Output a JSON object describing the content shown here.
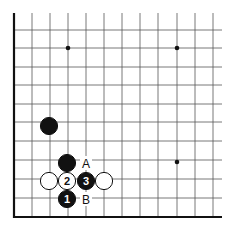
{
  "diagram": {
    "type": "go-board-corner",
    "corner": "bottom-left",
    "colors": {
      "line": "#555555",
      "border": "#111111",
      "black": "#111111",
      "white": "#ffffff",
      "background": "#ffffff"
    },
    "star_points": [
      {
        "x": 68,
        "y": 48
      },
      {
        "x": 177,
        "y": 48
      },
      {
        "x": 177,
        "y": 162
      }
    ],
    "stones": [
      {
        "id": "black-stone-upper",
        "color": "black",
        "x": 49,
        "y": 126,
        "label": ""
      },
      {
        "id": "black-stone-a",
        "color": "black",
        "x": 67,
        "y": 163,
        "label": ""
      },
      {
        "id": "white-stone-left",
        "color": "white",
        "x": 49,
        "y": 181,
        "label": ""
      },
      {
        "id": "white-stone-2",
        "color": "white",
        "x": 67,
        "y": 181,
        "label": "2"
      },
      {
        "id": "black-stone-3",
        "color": "black",
        "x": 86,
        "y": 181,
        "label": "3"
      },
      {
        "id": "white-stone-right",
        "color": "white",
        "x": 104,
        "y": 181,
        "label": ""
      },
      {
        "id": "black-stone-1",
        "color": "black",
        "x": 67,
        "y": 199,
        "label": "1"
      }
    ],
    "markers": [
      {
        "id": "point-a",
        "text": "A",
        "x": 86,
        "y": 163
      },
      {
        "id": "point-b",
        "text": "B",
        "x": 86,
        "y": 199
      }
    ]
  }
}
